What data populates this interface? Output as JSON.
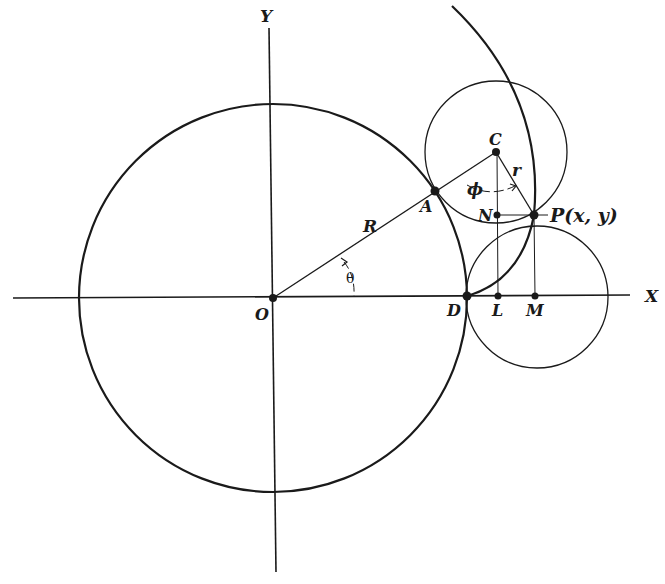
{
  "diagram": {
    "axes": {
      "x_label": "X",
      "y_label": "Y"
    },
    "points": {
      "O": {
        "label": "O"
      },
      "A": {
        "label": "A"
      },
      "C": {
        "label": "C"
      },
      "N": {
        "label": "N"
      },
      "P": {
        "label": "P(x, y)"
      },
      "D": {
        "label": "D"
      },
      "L": {
        "label": "L"
      },
      "M": {
        "label": "M"
      }
    },
    "segments": {
      "R": "R",
      "r": "r"
    },
    "angles": {
      "theta": "θ",
      "phi": "ϕ"
    },
    "colors": {
      "ink": "#1a1a1a",
      "background": "#ffffff"
    }
  }
}
